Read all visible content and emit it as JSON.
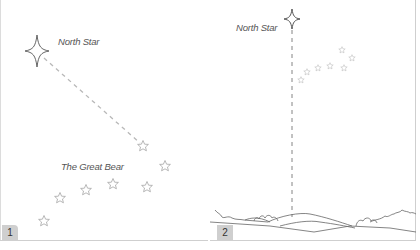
{
  "panels": [
    {
      "number": "1",
      "north_star_label": "North Star",
      "constellation_label": "The Great Bear"
    },
    {
      "number": "2",
      "north_star_label": "North Star"
    }
  ],
  "colors": {
    "line": "#555555",
    "dash": "#b5b5b5",
    "star_outline": "#9a9a9a",
    "faint_star": "#bdbdbd",
    "badge_bg": "#cfcfcf",
    "border": "#cfcfcf"
  }
}
